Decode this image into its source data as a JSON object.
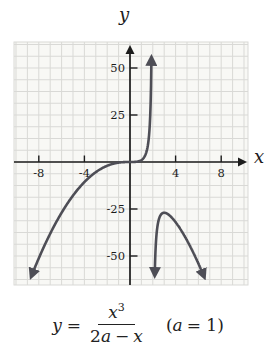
{
  "figure": {
    "x_axis_label": "x",
    "y_axis_label": "y"
  },
  "formula": {
    "lhs_var": "y",
    "equals": "=",
    "num_var": "x",
    "num_exp": "3",
    "den_coeff": "2",
    "den_var": "a",
    "den_op": "−",
    "den_x": "x",
    "note_open": "(",
    "note_a": "a",
    "note_rest": "= 1)"
  },
  "chart_data": {
    "type": "line",
    "title": "",
    "equation": "y = x^3 / (2a - x)",
    "a": 1,
    "vertical_asymptote_x": 2,
    "x_axis": {
      "label": "x",
      "ticks": [
        -8,
        -4,
        4,
        8
      ],
      "range": [
        -10.2,
        10.3
      ],
      "minor_grid_step": 1
    },
    "y_axis": {
      "label": "y",
      "ticks": [
        50,
        25,
        -25,
        -50
      ],
      "range": [
        -64,
        64
      ],
      "minor_grid_step": 6.25
    },
    "grid": true,
    "branches": [
      {
        "name": "left-of-asymptote",
        "x_from": -8.65,
        "x_to": 1.88,
        "arrow_start": true,
        "arrow_end": true
      },
      {
        "name": "right-of-asymptote",
        "x_from": 2.17,
        "x_to": 6.5,
        "arrow_start": true,
        "arrow_end": true,
        "local_max": {
          "x": 3,
          "y": -27
        }
      }
    ],
    "key_points": [
      {
        "x": 0,
        "y": 0,
        "note": "passes through origin"
      },
      {
        "x": 3,
        "y": -27,
        "note": "local maximum of right branch"
      }
    ],
    "colors": {
      "curve": "#4e4e56",
      "axis": "#1c1c1c",
      "grid": "#d9d9d6",
      "plot_bg": "#f8f8f5",
      "text": "#1c1c1c"
    }
  }
}
